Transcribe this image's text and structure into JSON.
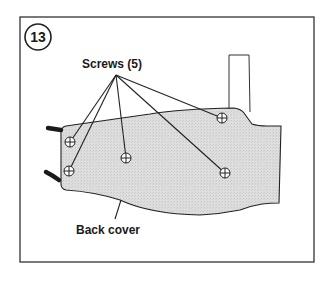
{
  "figure": {
    "step_number": "13",
    "callouts": [
      {
        "id": "screws",
        "label": "Screws (5)",
        "count": 5
      },
      {
        "id": "back-cover",
        "label": "Back cover"
      }
    ],
    "screws": [
      {
        "x": 70,
        "y": 142
      },
      {
        "x": 69,
        "y": 171
      },
      {
        "x": 126,
        "y": 158
      },
      {
        "x": 222,
        "y": 118
      },
      {
        "x": 225,
        "y": 173
      }
    ],
    "colors": {
      "frame": "#333333",
      "cover_fill": "#dcdcdc",
      "line": "#222222",
      "background": "#ffffff"
    }
  }
}
